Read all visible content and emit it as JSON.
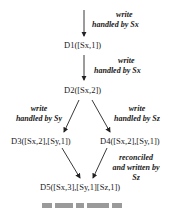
{
  "diagram": {
    "nodes": [
      {
        "id": "D1",
        "label": "D1([Sx,1])"
      },
      {
        "id": "D2",
        "label": "D2([Sx,2])"
      },
      {
        "id": "D3",
        "label": "D3([Sx,2],[Sy,1])"
      },
      {
        "id": "D4",
        "label": "D4([Sx,2],[Sy,1])"
      },
      {
        "id": "D5",
        "label": "D5([Sx,3],[Sy,1][Sz,1])"
      }
    ],
    "edges": [
      {
        "from": "start",
        "to": "D1",
        "label_line1": "write",
        "label_line2": "handled by Sx"
      },
      {
        "from": "D1",
        "to": "D2",
        "label_line1": "write",
        "label_line2": "handled by Sx"
      },
      {
        "from": "D2",
        "to": "D3",
        "label_line1": "write",
        "label_line2": "handled by Sy"
      },
      {
        "from": "D2",
        "to": "D4",
        "label_line1": "write",
        "label_line2": "handled by Sz"
      },
      {
        "from": "D3",
        "to": "D5",
        "label_line1": "",
        "label_line2": ""
      },
      {
        "from": "D4",
        "to": "D5",
        "label_line1": "reconciled",
        "label_line2": "and written by",
        "label_line3": "Sz"
      }
    ],
    "colors": {
      "line": "#222222",
      "text": "#1a1a1a"
    }
  }
}
